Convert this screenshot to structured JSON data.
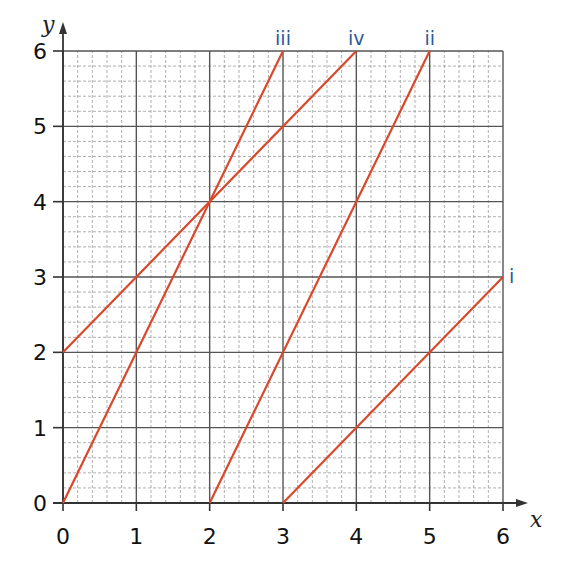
{
  "chart_data": {
    "type": "line",
    "title": "",
    "xlabel": "x",
    "ylabel": "y",
    "xlim": [
      0,
      6
    ],
    "ylim": [
      0,
      6
    ],
    "x_ticks": [
      "0",
      "1",
      "2",
      "3",
      "4",
      "5",
      "6"
    ],
    "y_ticks": [
      "0",
      "1",
      "2",
      "3",
      "4",
      "5",
      "6"
    ],
    "grid": {
      "major": true,
      "minor": true,
      "minor_per_unit": 5
    },
    "line_color": "#d9482b",
    "label_color": "#2a5a9a",
    "series": [
      {
        "name": "i",
        "points": [
          [
            3,
            0
          ],
          [
            6,
            3
          ]
        ]
      },
      {
        "name": "ii",
        "points": [
          [
            2,
            0
          ],
          [
            5,
            6
          ]
        ]
      },
      {
        "name": "iii",
        "points": [
          [
            0,
            0
          ],
          [
            3,
            6
          ]
        ]
      },
      {
        "name": "iv",
        "points": [
          [
            0,
            2
          ],
          [
            4,
            6
          ]
        ]
      }
    ]
  }
}
